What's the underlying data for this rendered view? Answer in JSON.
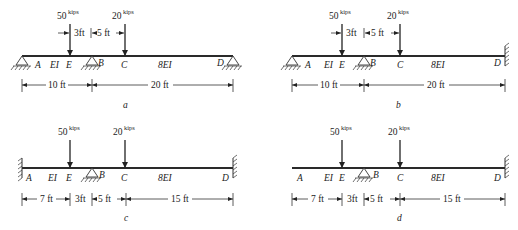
{
  "figure": {
    "colors": {
      "ink": "#222222",
      "background": "#ffffff"
    }
  },
  "loads": {
    "E": {
      "value": "50",
      "unit": "kips"
    },
    "C": {
      "value": "20",
      "unit": "kips"
    }
  },
  "stiffness": {
    "AB": "EI",
    "BD": "8EI"
  },
  "diagrams": [
    {
      "caption": "a",
      "points": {
        "A": "A",
        "E": "E",
        "B": "B",
        "C": "C",
        "D": "D"
      },
      "supports": {
        "A": "pin",
        "B": "pin",
        "D": "pin"
      },
      "load_dims": [
        "3ft",
        "5 ft"
      ],
      "dims": [
        "10 ft",
        "20 ft"
      ]
    },
    {
      "caption": "b",
      "points": {
        "A": "A",
        "E": "E",
        "B": "B",
        "C": "C",
        "D": "D"
      },
      "supports": {
        "A": "pin",
        "B": "pin",
        "D": "fixed"
      },
      "load_dims": [
        "3ft",
        "5 ft"
      ],
      "dims": [
        "10 ft",
        "20 ft"
      ]
    },
    {
      "caption": "c",
      "points": {
        "A": "A",
        "E": "E",
        "B": "B",
        "C": "C",
        "D": "D"
      },
      "supports": {
        "A": "fixed",
        "B": "pin",
        "D": "fixed"
      },
      "dims": [
        "7 ft",
        "3ft",
        "5 ft",
        "15 ft"
      ]
    },
    {
      "caption": "d",
      "points": {
        "A": "A",
        "E": "E",
        "B": "B",
        "C": "C",
        "D": "D"
      },
      "supports": {
        "A": "free",
        "B": "pin",
        "D": "fixed"
      },
      "dims": [
        "7 ft",
        "3ft",
        "5 ft",
        "15 ft"
      ]
    }
  ]
}
